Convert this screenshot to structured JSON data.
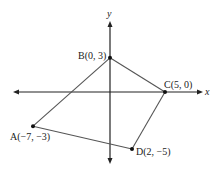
{
  "diagram": {
    "type": "coordinate-plane-quadrilateral",
    "axes": {
      "x_label": "x",
      "y_label": "y"
    },
    "points": [
      {
        "name": "A",
        "x": -7,
        "y": -3,
        "label": "A(−7, −3)"
      },
      {
        "name": "B",
        "x": 0,
        "y": 3,
        "label": "B(0, 3)"
      },
      {
        "name": "C",
        "x": 5,
        "y": 0,
        "label": "C(5, 0)"
      },
      {
        "name": "D",
        "x": 2,
        "y": -5,
        "label": "D(2, −5)"
      }
    ],
    "polygon_order": [
      "A",
      "B",
      "C",
      "D"
    ],
    "colors": {
      "axis": "#222222",
      "edge": "#555555",
      "point": "#111111"
    }
  }
}
